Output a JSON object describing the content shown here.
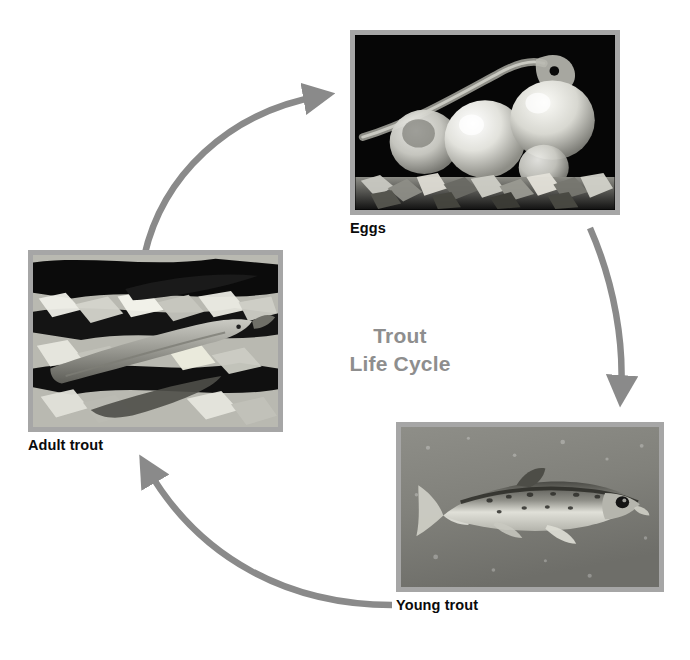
{
  "diagram": {
    "title_line1": "Trout",
    "title_line2": "Life Cycle",
    "title_color": "#8e8e8e",
    "arrow_color": "#8a8a8a",
    "frame_color": "#a6a6a6",
    "background_color": "#ffffff",
    "label_color": "#0b0b0b",
    "stages": [
      {
        "id": "eggs",
        "label": "Eggs",
        "position": "top-right",
        "image_description": "Close-up grayscale photograph of translucent trout eggs resting on gravel, with a hatching alevin emerging from one egg against a black background"
      },
      {
        "id": "young-trout",
        "label": "Young trout",
        "position": "bottom-right",
        "image_description": "Grayscale underwater photograph of a single young trout with spotted flank swimming to the right in grey water"
      },
      {
        "id": "adult-trout",
        "label": "Adult trout",
        "position": "left",
        "image_description": "High-contrast grayscale photograph of adult trout swimming over a rocky stream bed with dappled light"
      }
    ],
    "arrows": [
      {
        "id": "adult-to-eggs",
        "from": "adult-trout",
        "to": "eggs",
        "direction": "up-right"
      },
      {
        "id": "eggs-to-young",
        "from": "eggs",
        "to": "young-trout",
        "direction": "down"
      },
      {
        "id": "young-to-adult",
        "from": "young-trout",
        "to": "adult-trout",
        "direction": "left-up"
      }
    ]
  }
}
